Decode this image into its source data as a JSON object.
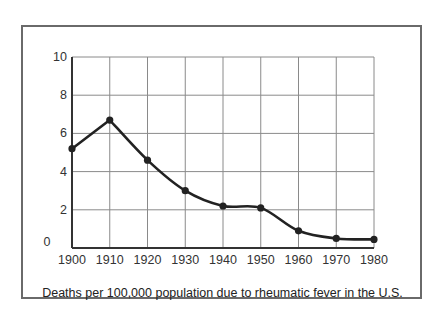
{
  "chart_data": {
    "type": "line",
    "title": "Deaths per 100,000 population due to rheumatic fever in the U.S.",
    "xlabel": "",
    "ylabel": "",
    "x": [
      1900,
      1910,
      1920,
      1930,
      1940,
      1950,
      1960,
      1970,
      1980
    ],
    "series": [
      {
        "name": "Deaths per 100,000",
        "values": [
          5.2,
          6.7,
          4.6,
          3.0,
          2.2,
          2.1,
          0.9,
          0.5,
          0.45
        ]
      }
    ],
    "xlim": [
      1900,
      1980
    ],
    "ylim": [
      0,
      10
    ],
    "x_ticks": [
      "1900",
      "1910",
      "1920",
      "1930",
      "1940",
      "1950",
      "1960",
      "1970",
      "1980"
    ],
    "y_ticks": [
      "0",
      "2",
      "4",
      "6",
      "8",
      "10"
    ],
    "grid": true,
    "legend": "none",
    "markers": true
  },
  "caption": "Deaths per 100,000 population due to rheumatic fever in the U.S.",
  "colors": {
    "line": "#222222",
    "grid": "#8a8a8a",
    "frame": "#6a6a6a"
  }
}
